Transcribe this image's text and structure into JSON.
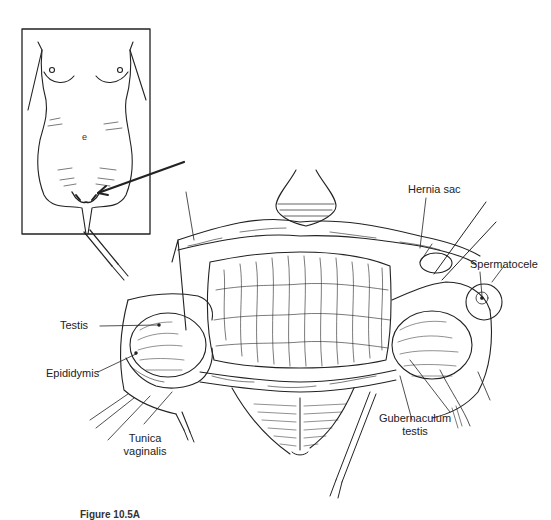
{
  "figure": {
    "inset": {
      "description": "Female-appearing body outline with arrow pointing to the inguinal/labial region",
      "letter": "e"
    },
    "labels": {
      "testis": "Testis",
      "epididymis": "Epididymis",
      "tunica_vaginalis_line1": "Tunica",
      "tunica_vaginalis_line2": "vaginalis",
      "hernia_sac": "Hernia sac",
      "spermatocele": "Spermatocele",
      "gubernaculum_line1": "Gubernaculum",
      "gubernaculum_line2": "testis"
    },
    "caption": {
      "prefix": "Figure 10.5A",
      "text": "(caption text clipped at bottom edge)"
    }
  }
}
